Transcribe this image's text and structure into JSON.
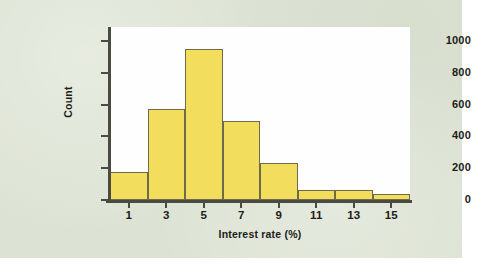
{
  "figure": {
    "background_color": "#dde3d4",
    "plot_background_color": "#fefefe",
    "bar_fill_color": "#f2de5c",
    "bar_edge_color": "#6f6a4a",
    "axis_color": "#4a4a42",
    "text_color": "#1d1d1a"
  },
  "chart_data": {
    "type": "bar",
    "title": "",
    "subtitle": "",
    "xlabel": "Interest rate (%)",
    "ylabel": "Count",
    "categories": [
      "1",
      "3",
      "5",
      "7",
      "9",
      "11",
      "13",
      "15"
    ],
    "bin_edges": [
      0,
      2,
      4,
      6,
      8,
      10,
      12,
      14,
      16
    ],
    "bin_centers": [
      1,
      3,
      5,
      7,
      9,
      11,
      13,
      15
    ],
    "values": [
      175,
      575,
      950,
      500,
      230,
      60,
      60,
      35
    ],
    "series": [
      {
        "name": "Count",
        "values": [
          175,
          575,
          950,
          500,
          230,
          60,
          60,
          35
        ]
      }
    ],
    "xlim": [
      0,
      16
    ],
    "ylim": [
      0,
      1000
    ],
    "x_tick_labels": [
      "1",
      "3",
      "5",
      "7",
      "9",
      "11",
      "13",
      "15"
    ],
    "x_tick_values": [
      1,
      3,
      5,
      7,
      9,
      11,
      13,
      15
    ],
    "y_tick_labels": [
      "0",
      "200",
      "400",
      "600",
      "800",
      "1000"
    ],
    "y_tick_values": [
      0,
      200,
      400,
      600,
      800,
      1000
    ],
    "grid": false,
    "legend": null,
    "legend_position": "none",
    "annotations": []
  }
}
